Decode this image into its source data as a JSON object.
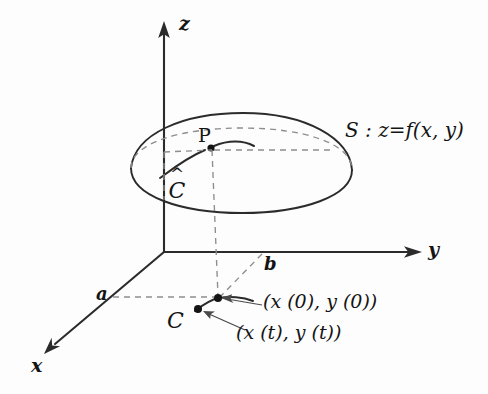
{
  "figure": {
    "axes": {
      "z_label": "z",
      "y_label": "y",
      "x_label": "x"
    },
    "labels": {
      "surface": "S : z=f(x, y)",
      "point_p": "P",
      "curve_hat_base": "C",
      "curve_hat_mark": "^",
      "curve_plane": "C",
      "param_a": "a",
      "param_b": "b",
      "coord_initial": "(x (0),  y (0))",
      "coord_time_t": "(x (t),  y (t))"
    },
    "colors": {
      "ink": "#141414",
      "axis": "#2b2b2b",
      "dashed": "#8d8d8d",
      "leader": "#4a4a4a",
      "background": "#fdfdfd"
    }
  }
}
